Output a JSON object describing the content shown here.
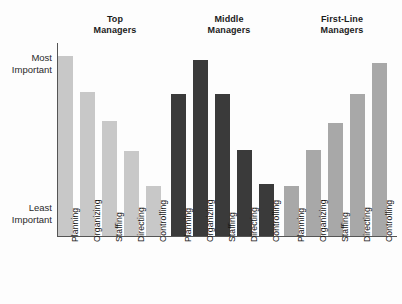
{
  "chart_data": {
    "type": "bar",
    "title": "",
    "xlabel": "",
    "ylabel": "",
    "grid": false,
    "legend_position": "none",
    "orientation": "vertical",
    "categories": [
      "Planning",
      "Organizing",
      "Staffing",
      "Directing",
      "Controlling"
    ],
    "y_axis": {
      "tick_labels": [
        "Most\nImportant",
        "Least\nImportant"
      ],
      "top_label": "Most\nImportant",
      "bottom_label": "Least\nImportant",
      "ylim": [
        0,
        100
      ],
      "scale": "qualitative"
    },
    "series": [
      {
        "name": "Top\nManagers",
        "display_name": "Top Managers",
        "color": "#c8c8c8",
        "values": [
          100,
          80,
          64,
          47,
          28
        ]
      },
      {
        "name": "Middle\nManagers",
        "display_name": "Middle Managers",
        "color": "#3a3a3a",
        "values": [
          79,
          98,
          79,
          48,
          29
        ]
      },
      {
        "name": "First-Line\nManagers",
        "display_name": "First-Line Managers",
        "color": "#a8a8a8",
        "values": [
          28,
          48,
          63,
          79,
          96
        ]
      }
    ]
  },
  "colors": {
    "background": "#fdfdfd",
    "axis": "#555555",
    "text": "#1b1b1b",
    "top_managers": "#c8c8c8",
    "middle_managers": "#3a3a3a",
    "first_line_managers": "#a8a8a8"
  }
}
